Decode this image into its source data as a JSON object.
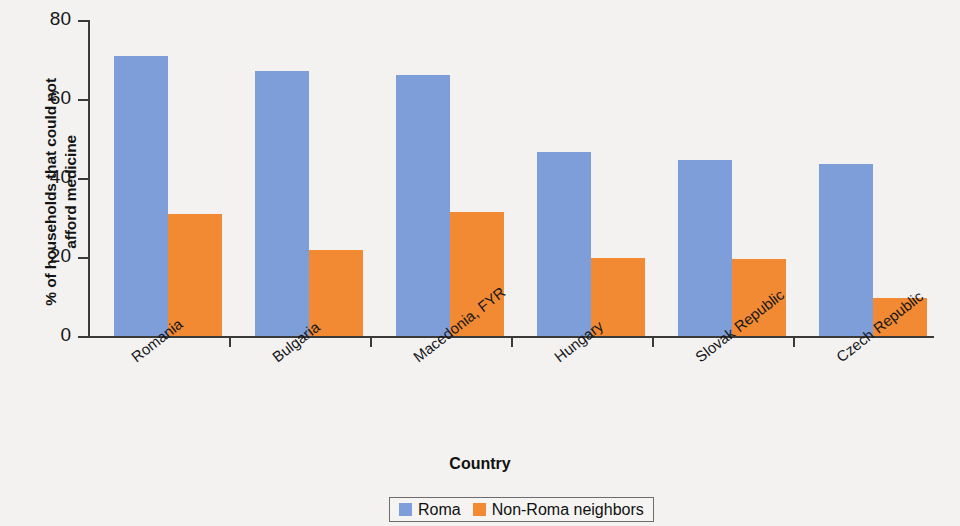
{
  "chart_data": {
    "type": "bar",
    "title": "",
    "xlabel": "Country",
    "ylabel": "% of households that could not afford medicine",
    "ylabel_line1": "% of households that could not",
    "ylabel_line2": "afford medicine",
    "categories": [
      "Romania",
      "Bulgaria",
      "Macedonia, FYR",
      "Hungary",
      "Slovak Republic",
      "Czech Republic"
    ],
    "series": [
      {
        "name": "Roma",
        "color": "#7e9ed9",
        "values": [
          71,
          67,
          66,
          46.5,
          44.5,
          43.5
        ]
      },
      {
        "name": "Non-Roma neighbors",
        "color": "#f18a33",
        "values": [
          31,
          21.8,
          31.5,
          19.8,
          19.6,
          9.5
        ]
      }
    ],
    "ylim": [
      0,
      80
    ],
    "yticks": [
      0,
      20,
      40,
      60,
      80
    ],
    "ytick_labels": [
      "0",
      "20",
      "40",
      "60",
      "80"
    ],
    "grid": false,
    "legend_position": "bottom-center"
  },
  "legend": {
    "items": [
      {
        "label": "Roma",
        "color": "#7e9ed9"
      },
      {
        "label": "Non-Roma neighbors",
        "color": "#f18a33"
      }
    ]
  },
  "colors": {
    "roma": "#7e9ed9",
    "non_roma": "#f18a33",
    "axis": "#3a3a3a",
    "background": "#f3f2f0"
  }
}
